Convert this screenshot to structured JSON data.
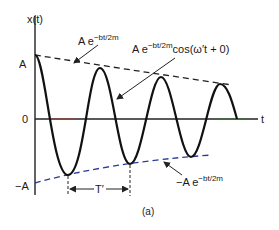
{
  "diagram": {
    "type": "damped-oscillation-plot",
    "y_axis_label": "x(t)",
    "x_axis_label": "t",
    "y_ticks": {
      "top": "A",
      "zero": "0",
      "bottom": "−A"
    },
    "upper_envelope_label": {
      "base": "A e",
      "exponent": "−bt/2m"
    },
    "curve_label": {
      "base": "A e",
      "exponent": "−bt/2m",
      "suffix": "cos(ω′t + 0)"
    },
    "lower_envelope_label": {
      "base": "−A e",
      "exponent": "−bt/2m"
    },
    "period_label": "T′",
    "caption": "(a)",
    "colors": {
      "curve": "#111111",
      "axis": "#222222",
      "envelope": "#222222",
      "axis_tint_red": "#c0392b",
      "axis_tint_green": "#2e7d32",
      "envelope_tint_blue": "#2a3a9a"
    }
  }
}
